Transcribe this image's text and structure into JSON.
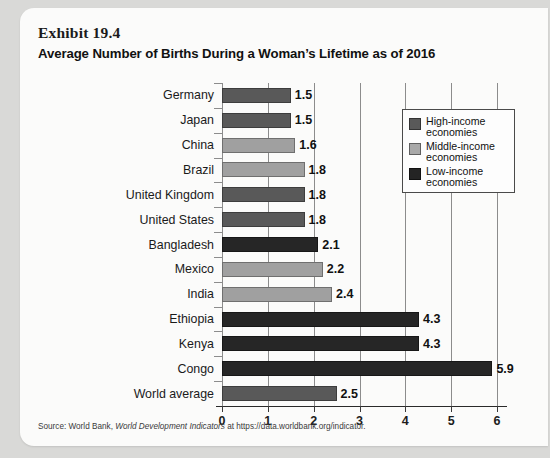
{
  "exhibit": {
    "number_label": "Exhibit 19.4",
    "title": "Average Number of Births During a Woman’s Lifetime as of 2016"
  },
  "source": {
    "prefix": "Source: World Bank, ",
    "italic": "World Development Indicators",
    "suffix": " at https://data.worldbank.org/indicator."
  },
  "legend": {
    "items": [
      {
        "label": "High-income economies",
        "group": "hi",
        "color": "#595959"
      },
      {
        "label": "Middle-income economies",
        "group": "mid",
        "color": "#a8a8a8"
      },
      {
        "label": "Low-income economies",
        "group": "low",
        "color": "#242424"
      }
    ]
  },
  "chart_data": {
    "type": "bar",
    "orientation": "horizontal",
    "title": "Average Number of Births During a Woman’s Lifetime as of 2016",
    "xlabel": "",
    "ylabel": "",
    "xlim": [
      0,
      6
    ],
    "xticks": [
      0,
      1,
      2,
      3,
      4,
      5,
      6
    ],
    "xticklabels": [
      "0",
      "1",
      "2",
      "3",
      "4",
      "5",
      "6"
    ],
    "grid": "vertical",
    "legend_position": "upper-right-inside",
    "categories": [
      "Germany",
      "Japan",
      "China",
      "Brazil",
      "United Kingdom",
      "United States",
      "Bangladesh",
      "Mexico",
      "India",
      "Ethiopia",
      "Kenya",
      "Congo",
      "World average"
    ],
    "values": [
      1.5,
      1.5,
      1.6,
      1.8,
      1.8,
      1.8,
      2.1,
      2.2,
      2.4,
      4.3,
      4.3,
      5.9,
      2.5
    ],
    "value_labels": [
      "1.5",
      "1.5",
      "1.6",
      "1.8",
      "1.8",
      "1.8",
      "2.1",
      "2.2",
      "2.4",
      "4.3",
      "4.3",
      "5.9",
      "2.5"
    ],
    "groups": [
      "hi",
      "hi",
      "mid",
      "mid",
      "hi",
      "hi",
      "low",
      "mid",
      "mid",
      "low",
      "low",
      "low",
      "hi"
    ],
    "group_colors": {
      "hi": "#595959",
      "mid": "#a0a0a0",
      "low": "#262626"
    },
    "series": [
      {
        "name": "High-income economies",
        "color": "#595959"
      },
      {
        "name": "Middle-income economies",
        "color": "#a0a0a0"
      },
      {
        "name": "Low-income economies",
        "color": "#262626"
      }
    ]
  }
}
